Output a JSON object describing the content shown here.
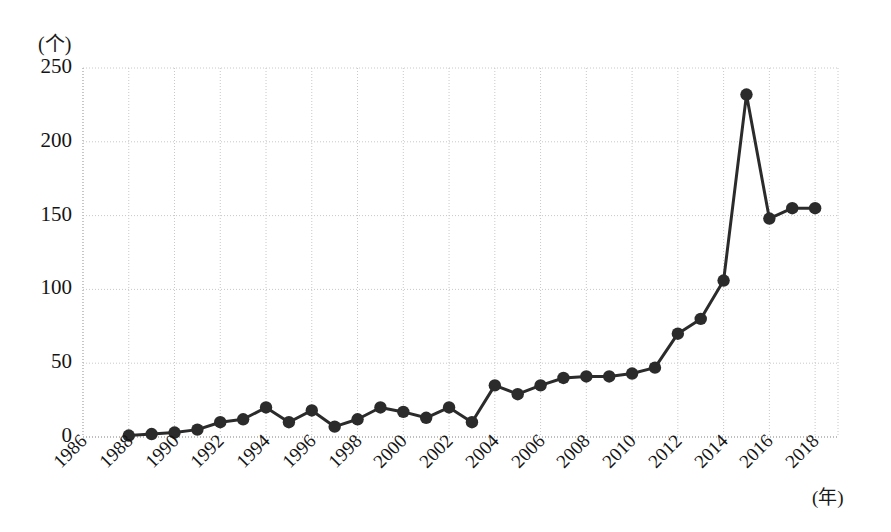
{
  "chart_data": {
    "type": "line",
    "title": "",
    "subtitle": "",
    "xlabel": "(年)",
    "ylabel": "(个)",
    "xlim": [
      1986,
      2019
    ],
    "ylim": [
      0,
      250
    ],
    "grid": true,
    "legend": null,
    "marker": "circle",
    "line_color": "#2b2b2b",
    "marker_color": "#2b2b2b",
    "grid_color": "#c8c8c8",
    "x": [
      1988,
      1989,
      1990,
      1991,
      1992,
      1993,
      1994,
      1995,
      1996,
      1997,
      1998,
      1999,
      2000,
      2001,
      2002,
      2003,
      2004,
      2005,
      2006,
      2007,
      2008,
      2009,
      2010,
      2011,
      2012,
      2013,
      2014,
      2015,
      2016,
      2017,
      2018
    ],
    "values": [
      1,
      2,
      3,
      5,
      10,
      12,
      20,
      10,
      18,
      7,
      12,
      20,
      17,
      13,
      20,
      10,
      35,
      29,
      35,
      40,
      41,
      41,
      43,
      47,
      70,
      80,
      106,
      232,
      148,
      155,
      155
    ],
    "xticks": [
      "1986",
      "1988",
      "1990",
      "1992",
      "1994",
      "1996",
      "1998",
      "2000",
      "2002",
      "2004",
      "2006",
      "2008",
      "2010",
      "2012",
      "2014",
      "2016",
      "2018"
    ],
    "xtick_values": [
      1986,
      1988,
      1990,
      1992,
      1994,
      1996,
      1998,
      2000,
      2002,
      2004,
      2006,
      2008,
      2010,
      2012,
      2014,
      2016,
      2018
    ],
    "yticks": [
      "0",
      "50",
      "100",
      "150",
      "200",
      "250"
    ],
    "ytick_values": [
      0,
      50,
      100,
      150,
      200,
      250
    ]
  }
}
